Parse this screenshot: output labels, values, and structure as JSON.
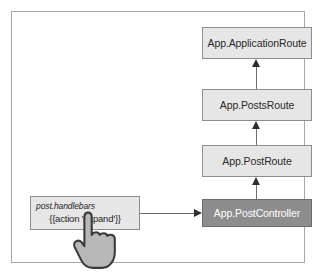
{
  "diagram": {
    "frame": {
      "border_color": "#a8a8a8",
      "background": "#ffffff"
    },
    "colors": {
      "node_fill": "#e6e6e6",
      "node_border": "#8e8e8e",
      "highlight_fill": "#8d8d8d",
      "highlight_text": "#ffffff",
      "connector": "#6e6e6e",
      "arrowhead": "#2d2d2d"
    },
    "nodes": [
      {
        "id": "application-route",
        "label": "App.ApplicationRoute",
        "style": "normal"
      },
      {
        "id": "posts-route",
        "label": "App.PostsRoute",
        "style": "normal"
      },
      {
        "id": "post-route",
        "label": "App.PostRoute",
        "style": "normal"
      },
      {
        "id": "post-controller",
        "label": "App.PostController",
        "style": "highlight"
      }
    ],
    "template_box": {
      "file_name": "post.handlebars",
      "expression": "{{action 'expand'}}"
    },
    "cursor": {
      "icon": "pointing-hand-cursor",
      "fill": "#b0b0b0",
      "outline": "#3a3a3a"
    },
    "connectors": [
      {
        "id": "posts-to-application",
        "from": "posts-route",
        "to": "application-route",
        "direction": "up"
      },
      {
        "id": "post-to-posts",
        "from": "post-route",
        "to": "posts-route",
        "direction": "up"
      },
      {
        "id": "controller-to-post",
        "from": "post-controller",
        "to": "post-route",
        "direction": "up"
      },
      {
        "id": "template-to-controller",
        "from": "template-box",
        "to": "post-controller",
        "direction": "right"
      }
    ]
  }
}
